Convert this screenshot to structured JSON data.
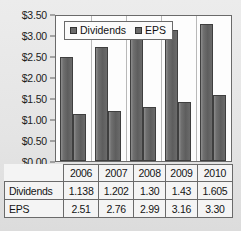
{
  "chart_data": {
    "type": "bar",
    "title": "",
    "xlabel": "",
    "ylabel": "",
    "categories": [
      "2006",
      "2007",
      "2008",
      "2009",
      "2010"
    ],
    "series": [
      {
        "name": "Dividends",
        "values": [
          1.138,
          1.202,
          1.3,
          1.43,
          1.605
        ]
      },
      {
        "name": "EPS",
        "values": [
          2.51,
          2.76,
          2.99,
          3.16,
          3.3
        ]
      }
    ],
    "bar_order_in_group": [
      "EPS",
      "Dividends"
    ],
    "ylim": [
      0,
      3.5
    ],
    "ytick_step": 0.5,
    "ytick_labels": [
      "$0.00",
      "$0.50",
      "$1.00",
      "$1.50",
      "$2.00",
      "$2.50",
      "$3.00",
      "$3.50"
    ],
    "grid": false,
    "legend_position": "inside-top-left",
    "colors": {
      "bar": "#6a6a6a",
      "bar_border": "#3f3f3f",
      "plot_background": "#fdfdfd",
      "plot_border": "#6a6a6a",
      "page_background": "#e8e8e8"
    }
  },
  "legend": {
    "entries": [
      {
        "label": "Dividends"
      },
      {
        "label": "EPS"
      }
    ]
  },
  "table": {
    "years": [
      "2006",
      "2007",
      "2008",
      "2009",
      "2010"
    ],
    "rows": [
      {
        "label": "Dividends",
        "values": [
          "1.138",
          "1.202",
          "1.30",
          "1.43",
          "1.605"
        ]
      },
      {
        "label": "EPS",
        "values": [
          "2.51",
          "2.76",
          "2.99",
          "3.16",
          "3.30"
        ]
      }
    ]
  }
}
